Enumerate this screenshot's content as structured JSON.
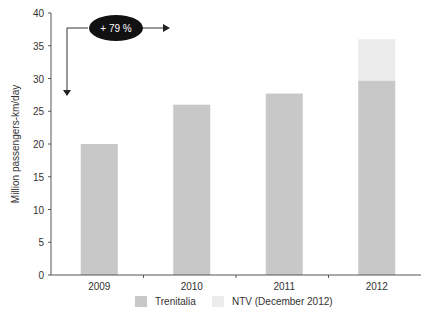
{
  "chart_data": {
    "type": "bar",
    "stacked": true,
    "title": "",
    "xlabel": "",
    "ylabel": "Million passengers-km/day",
    "ylim": [
      0,
      40
    ],
    "yticks": [
      0,
      5,
      10,
      15,
      20,
      25,
      30,
      35,
      40
    ],
    "categories": [
      "2009",
      "2010",
      "2011",
      "2012"
    ],
    "series": [
      {
        "name": "Trenitalia",
        "color": "#c8c8c8",
        "values": [
          20,
          26,
          27.7,
          29.7
        ]
      },
      {
        "name": "NTV (December 2012)",
        "color": "#ececec",
        "values": [
          0,
          0,
          0,
          6.3
        ]
      }
    ],
    "annotation": {
      "text": "+ 79 %",
      "shape": "black-ellipse-with-arrows"
    },
    "grid": false,
    "legend_position": "bottom"
  }
}
